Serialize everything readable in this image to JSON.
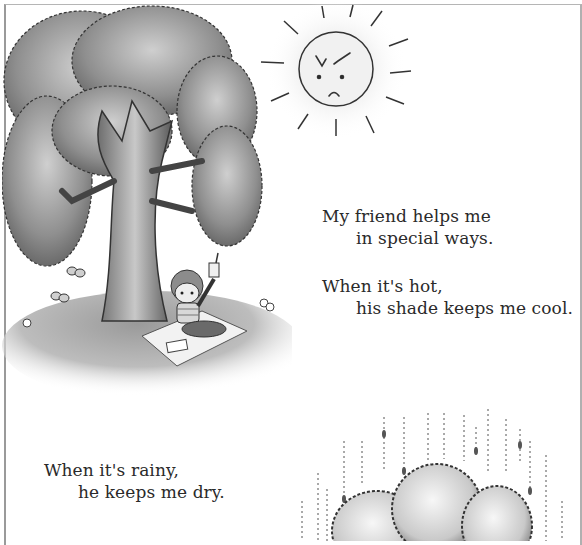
{
  "page": {
    "illustrations": {
      "tree": "tree-with-boy-under-shade",
      "sun": "angry-sun-face",
      "cloud": "tree-canopy-in-rain"
    },
    "colors": {
      "ink": "#2a2a2a",
      "foliage_dark": "#6e6e6e",
      "foliage_light": "#bdbdbd",
      "trunk": "#8a8a8a",
      "border": "#9a9a9a"
    }
  },
  "verses": [
    {
      "line1": "My friend helps me",
      "line2": "in special ways."
    },
    {
      "line1": "When it's hot,",
      "line2": "his shade keeps me cool."
    },
    {
      "line1": "When it's rainy,",
      "line2": "he keeps me dry."
    }
  ]
}
